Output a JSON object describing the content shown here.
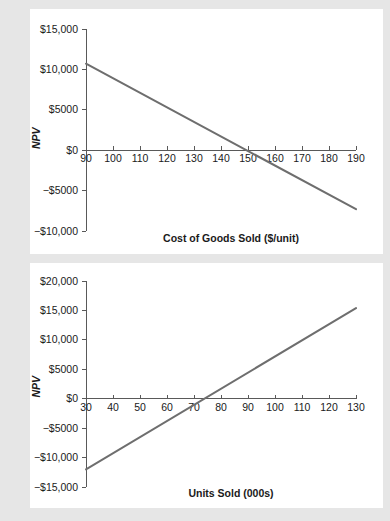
{
  "page": {
    "background_color": "#e6e6e6",
    "panel_color": "#ffffff"
  },
  "chart_data": [
    {
      "id": "npv-vs-cogs",
      "type": "line",
      "title": "",
      "xlabel": "Cost of Goods Sold ($/unit)",
      "ylabel": "NPV",
      "xlim": [
        90,
        190
      ],
      "ylim": [
        -10000,
        15000
      ],
      "grid": false,
      "legend": "none",
      "line_color": "#6e6e6e",
      "x_ticks": [
        90,
        100,
        110,
        120,
        130,
        140,
        150,
        160,
        170,
        180,
        190
      ],
      "x_tick_labels": [
        "90",
        "100",
        "110",
        "120",
        "130",
        "140",
        "150",
        "160",
        "170",
        "180",
        "190"
      ],
      "y_ticks": [
        15000,
        10000,
        5000,
        0,
        -5000,
        -10000
      ],
      "y_tick_labels": [
        "$15,000",
        "$10,000",
        "$5000",
        "$0",
        "−$5000",
        "−$10,000"
      ],
      "x": [
        90,
        190
      ],
      "values": [
        10700,
        -7300
      ],
      "zero_crossing_x": 151,
      "series": [
        {
          "name": "NPV",
          "x": [
            90,
            190
          ],
          "values": [
            10700,
            -7300
          ]
        }
      ]
    },
    {
      "id": "npv-vs-units",
      "type": "line",
      "title": "",
      "xlabel": "Units Sold (000s)",
      "ylabel": "NPV",
      "xlim": [
        30,
        130
      ],
      "ylim": [
        -15000,
        20000
      ],
      "grid": false,
      "legend": "none",
      "line_color": "#6e6e6e",
      "x_ticks": [
        30,
        40,
        50,
        60,
        70,
        80,
        90,
        100,
        110,
        120,
        130
      ],
      "x_tick_labels": [
        "30",
        "40",
        "50",
        "60",
        "70",
        "80",
        "90",
        "100",
        "110",
        "120",
        "130"
      ],
      "y_ticks": [
        20000,
        15000,
        10000,
        5000,
        0,
        -5000,
        -10000,
        -15000
      ],
      "y_tick_labels": [
        "$20,000",
        "$15,000",
        "$10,000",
        "$5000",
        "$0",
        "−$5000",
        "−$10,000",
        "−$15,000"
      ],
      "x": [
        30,
        130
      ],
      "values": [
        -12000,
        15400
      ],
      "zero_crossing_x": 74,
      "series": [
        {
          "name": "NPV",
          "x": [
            30,
            130
          ],
          "values": [
            -12000,
            15400
          ]
        }
      ]
    }
  ]
}
